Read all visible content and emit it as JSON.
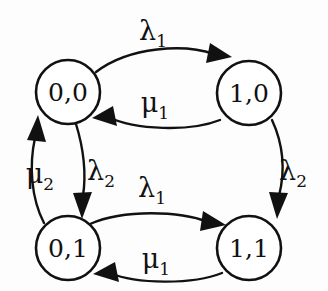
{
  "diagram": {
    "type": "state-transition-diagram",
    "title": "",
    "background_color": "#fdfdfd",
    "line_color": "#111111",
    "node_fill": "#ffffff",
    "nodes": [
      {
        "id": "s00",
        "label": "0,0",
        "cx": 68,
        "cy": 92,
        "r": 32
      },
      {
        "id": "s10",
        "label": "1,0",
        "cx": 249,
        "cy": 93,
        "r": 32
      },
      {
        "id": "s01",
        "label": "0,1",
        "cx": 68,
        "cy": 248,
        "r": 32
      },
      {
        "id": "s11",
        "label": "1,1",
        "cx": 249,
        "cy": 248,
        "r": 32
      }
    ],
    "edges": [
      {
        "id": "e-top-lambda1",
        "from": "0,0",
        "to": "1,0",
        "symbol": "λ",
        "subscript": "1",
        "label": "λ₁",
        "direction": "right",
        "label_x": 153,
        "label_y": 40
      },
      {
        "id": "e-top-mu1",
        "from": "1,0",
        "to": "0,0",
        "symbol": "μ",
        "subscript": "1",
        "label": "μ₁",
        "direction": "left",
        "label_x": 155,
        "label_y": 112
      },
      {
        "id": "e-bottom-lambda1",
        "from": "0,1",
        "to": "1,1",
        "symbol": "λ",
        "subscript": "1",
        "label": "λ₁",
        "direction": "right",
        "label_x": 152,
        "label_y": 197
      },
      {
        "id": "e-bottom-mu1",
        "from": "1,1",
        "to": "0,1",
        "symbol": "μ",
        "subscript": "1",
        "label": "μ₁",
        "direction": "left",
        "label_x": 156,
        "label_y": 268
      },
      {
        "id": "e-left-mu2",
        "from": "0,1",
        "to": "0,0",
        "symbol": "μ",
        "subscript": "2",
        "label": "μ₂",
        "direction": "up",
        "label_x": 40,
        "label_y": 183
      },
      {
        "id": "e-left-lambda2",
        "from": "0,0",
        "to": "0,1",
        "symbol": "λ",
        "subscript": "2",
        "label": "λ₂",
        "direction": "down",
        "label_x": 101,
        "label_y": 180
      },
      {
        "id": "e-right-lambda2",
        "from": "1,0",
        "to": "1,1",
        "symbol": "λ",
        "subscript": "2",
        "label": "λ₂",
        "direction": "down",
        "label_x": 293,
        "label_y": 180
      }
    ]
  }
}
